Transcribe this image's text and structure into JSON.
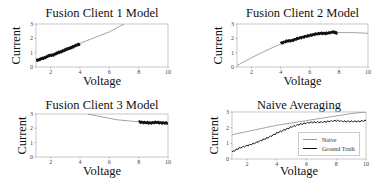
{
  "chart_data": [
    {
      "type": "line",
      "title": "Fusion Client 1 Model",
      "xlabel": "Voltage",
      "ylabel": "Current",
      "xlim": [
        1,
        10
      ],
      "ylim": [
        0,
        3
      ],
      "xticks": [
        2,
        4,
        6,
        8,
        10
      ],
      "yticks": [
        0,
        1,
        2,
        3
      ],
      "grid": false,
      "series": [
        {
          "name": "Model",
          "style": "thin-gray",
          "x": [
            1.0,
            2.0,
            3.0,
            4.0,
            5.0,
            6.0,
            7.0
          ],
          "y": [
            0.45,
            0.85,
            1.25,
            1.65,
            2.05,
            2.45,
            3.0
          ]
        },
        {
          "name": "Client data",
          "style": "thick-black-noisy",
          "x": [
            1.0,
            1.3,
            1.6,
            1.9,
            2.2,
            2.5,
            2.8,
            3.1,
            3.4,
            3.7,
            4.0
          ],
          "y": [
            0.45,
            0.55,
            0.65,
            0.8,
            0.85,
            1.0,
            1.1,
            1.25,
            1.35,
            1.5,
            1.6
          ]
        }
      ]
    },
    {
      "type": "line",
      "title": "Fusion Client 2 Model",
      "xlabel": "Voltage",
      "ylabel": "Current",
      "xlim": [
        1,
        10
      ],
      "ylim": [
        0,
        3
      ],
      "xticks": [
        2,
        4,
        6,
        8,
        10
      ],
      "yticks": [
        0,
        1,
        2,
        3
      ],
      "grid": false,
      "series": [
        {
          "name": "Model",
          "style": "thin-gray",
          "x": [
            1.0,
            2.0,
            3.0,
            4.0,
            5.0,
            6.0,
            7.0,
            8.0,
            9.0,
            10.0
          ],
          "y": [
            0.1,
            0.65,
            1.15,
            1.6,
            1.95,
            2.2,
            2.35,
            2.4,
            2.4,
            2.35
          ]
        },
        {
          "name": "Client data",
          "style": "thick-black-noisy",
          "x": [
            4.0,
            4.4,
            4.8,
            5.2,
            5.6,
            6.0,
            6.4,
            6.8,
            7.2,
            7.6,
            7.9
          ],
          "y": [
            1.65,
            1.8,
            1.85,
            2.0,
            2.1,
            2.2,
            2.3,
            2.35,
            2.35,
            2.45,
            2.35
          ]
        }
      ]
    },
    {
      "type": "line",
      "title": "Fusion Client 3 Model",
      "xlabel": "Voltage",
      "ylabel": "Current",
      "xlim": [
        1,
        10
      ],
      "ylim": [
        0,
        3
      ],
      "xticks": [
        2,
        4,
        6,
        8,
        10
      ],
      "yticks": [
        0,
        1,
        2,
        3
      ],
      "grid": false,
      "series": [
        {
          "name": "Model",
          "style": "thin-gray",
          "x": [
            4.5,
            5.5,
            6.5,
            7.5,
            8.5,
            10.0
          ],
          "y": [
            3.0,
            2.8,
            2.6,
            2.5,
            2.42,
            2.35
          ]
        },
        {
          "name": "Client data",
          "style": "thick-black-noisy",
          "x": [
            8.0,
            8.4,
            8.8,
            9.2,
            9.6,
            10.0
          ],
          "y": [
            2.45,
            2.4,
            2.38,
            2.42,
            2.38,
            2.36
          ]
        }
      ]
    },
    {
      "type": "line",
      "title": "Naive Averaging",
      "xlabel": "Voltage",
      "ylabel": "Current",
      "xlim": [
        1,
        10
      ],
      "ylim": [
        0,
        3
      ],
      "xticks": [
        2,
        4,
        6,
        8,
        10
      ],
      "yticks": [
        0,
        1,
        2,
        3
      ],
      "grid": false,
      "legend": {
        "position": "lower right",
        "entries": [
          "Naive",
          "Ground Truth"
        ]
      },
      "series": [
        {
          "name": "Naive",
          "style": "thin-gray",
          "x": [
            1.0,
            2.0,
            3.0,
            4.0,
            5.0,
            6.0,
            7.0,
            8.0,
            9.0,
            10.0
          ],
          "y": [
            1.55,
            1.75,
            1.95,
            2.15,
            2.3,
            2.45,
            2.6,
            2.75,
            2.9,
            3.0
          ]
        },
        {
          "name": "Ground Truth",
          "style": "black",
          "x": [
            1.0,
            1.5,
            2.0,
            2.5,
            3.0,
            3.5,
            4.0,
            4.5,
            5.0,
            5.5,
            6.0,
            6.5,
            7.0,
            7.5,
            8.0,
            8.5,
            9.0,
            9.5,
            10.0
          ],
          "y": [
            0.45,
            0.7,
            0.85,
            1.0,
            1.2,
            1.4,
            1.65,
            1.85,
            2.05,
            2.2,
            2.3,
            2.35,
            2.35,
            2.4,
            2.45,
            2.4,
            2.4,
            2.4,
            2.45
          ]
        }
      ]
    }
  ]
}
